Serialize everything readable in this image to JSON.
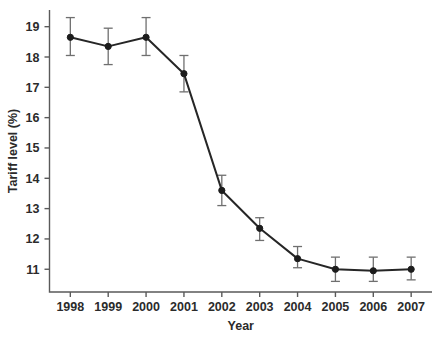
{
  "chart_data": {
    "type": "line",
    "title": "",
    "subtitle": "",
    "xlabel": "Year",
    "ylabel": "Tariff level (%)",
    "categories": [
      "1998",
      "1999",
      "2000",
      "2001",
      "2002",
      "2003",
      "2004",
      "2005",
      "2006",
      "2007"
    ],
    "x": [
      1998,
      1999,
      2000,
      2001,
      2002,
      2003,
      2004,
      2005,
      2006,
      2007
    ],
    "values": [
      18.65,
      18.35,
      18.65,
      17.45,
      13.6,
      12.35,
      11.35,
      11.0,
      10.95,
      11.0
    ],
    "error_low": [
      18.05,
      17.75,
      18.05,
      16.85,
      13.1,
      11.95,
      11.05,
      10.6,
      10.6,
      10.65
    ],
    "error_high": [
      19.3,
      18.95,
      19.3,
      18.05,
      14.1,
      12.7,
      11.75,
      11.4,
      11.4,
      11.4
    ],
    "error_pm": [
      0.62,
      0.6,
      0.62,
      0.6,
      0.5,
      0.38,
      0.35,
      0.4,
      0.4,
      0.38
    ],
    "series": [
      {
        "name": "Tariff level",
        "values": [
          18.65,
          18.35,
          18.65,
          17.45,
          13.6,
          12.35,
          11.35,
          11.0,
          10.95,
          11.0
        ]
      }
    ],
    "ytick_labels": [
      "11",
      "12",
      "13",
      "14",
      "15",
      "16",
      "17",
      "18",
      "19"
    ],
    "ytick_values": [
      11,
      12,
      13,
      14,
      15,
      16,
      17,
      18,
      19
    ],
    "xtick_labels": [
      "1998",
      "1999",
      "2000",
      "2001",
      "2002",
      "2003",
      "2004",
      "2005",
      "2006",
      "2007"
    ],
    "ylim": [
      10.25,
      19.55
    ],
    "xlim": [
      1997.45,
      2007.55
    ],
    "grid": false,
    "legend": false,
    "legend_position": "none",
    "marker": "circle",
    "line_color": "#262626",
    "marker_color": "#1c1c1c",
    "error_bar_color": "#6f6f6f",
    "background_color": "#ffffff",
    "axis_color": "#5a5a5a",
    "text_color": "#2b2b2b"
  }
}
